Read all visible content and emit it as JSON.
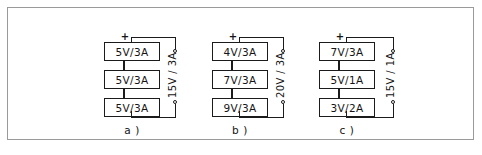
{
  "figure": {
    "background_color": "#ffffff",
    "frame_color": "#9a9a9a",
    "line_color": "#1b1b1b",
    "plus_sign": "+",
    "minus_sign": "−"
  },
  "circuits": [
    {
      "id": "a",
      "caption": "a )",
      "cells": [
        {
          "label": "5V/3A"
        },
        {
          "label": "5V/3A"
        },
        {
          "label": "5V/3A"
        }
      ],
      "output": "15V / 3A"
    },
    {
      "id": "b",
      "caption": "b )",
      "cells": [
        {
          "label": "4V/3A"
        },
        {
          "label": "7V/3A"
        },
        {
          "label": "9V/3A"
        }
      ],
      "output": "20V / 3A"
    },
    {
      "id": "c",
      "caption": "c )",
      "cells": [
        {
          "label": "7V/3A"
        },
        {
          "label": "5V/1A"
        },
        {
          "label": "3V/2A"
        }
      ],
      "output": "15V / 1A"
    }
  ]
}
